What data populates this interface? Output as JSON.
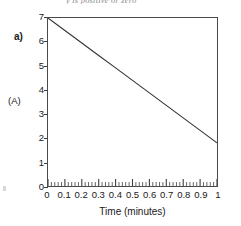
{
  "figure": {
    "part_label": "a)",
    "top_cut_text": "y is positive or zero",
    "caption_note": ""
  },
  "chart_data": {
    "type": "line",
    "title": "",
    "subtitle": "",
    "xlabel": "Time (minutes)",
    "ylabel": "(A)",
    "xlim": [
      0,
      1
    ],
    "ylim": [
      0,
      7
    ],
    "grid": false,
    "legend": null,
    "legend_position": "none",
    "x_tick_labels": [
      "0",
      "0.1",
      "0.2",
      "0.3",
      "0.4",
      "0.5",
      "0.6",
      "0.7",
      "0.8",
      "0.9",
      "1"
    ],
    "x_tick_values": [
      0,
      0.1,
      0.2,
      0.3,
      0.4,
      0.5,
      0.6,
      0.7,
      0.8,
      0.9,
      1
    ],
    "x_minor_tick_step": 0.02,
    "y_tick_labels": [
      "0",
      "1",
      "2",
      "3",
      "4",
      "5",
      "6",
      "7"
    ],
    "y_tick_values": [
      0,
      1,
      2,
      3,
      4,
      5,
      6,
      7
    ],
    "series": [
      {
        "name": "(A)",
        "color": "#333333",
        "x": [
          0,
          0.1,
          0.2,
          0.3,
          0.4,
          0.5,
          0.6,
          0.7,
          0.8,
          0.9,
          1
        ],
        "values": [
          7.0,
          6.48,
          5.96,
          5.44,
          4.92,
          4.4,
          3.88,
          3.36,
          2.84,
          2.32,
          1.8
        ]
      }
    ],
    "annotations": []
  },
  "style": {
    "line_color": "#333333",
    "axis_color": "#4a4a4a",
    "text_color": "#202020",
    "background": "#ffffff"
  }
}
